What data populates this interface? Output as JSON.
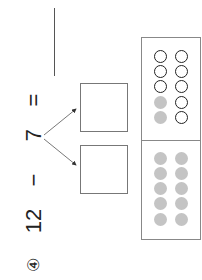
{
  "problem": {
    "number_badge": "④",
    "minuend": "12",
    "operator": "−",
    "subtrahend": "7",
    "equals": "=",
    "answer": ""
  },
  "decomposition": {
    "boxes": [
      {
        "value": ""
      },
      {
        "value": ""
      }
    ]
  },
  "ten_frame": {
    "top_half": {
      "column_1": [
        "open",
        "open",
        "open",
        "filled",
        "filled"
      ],
      "column_2": [
        "open",
        "open",
        "open",
        "open",
        "open"
      ]
    },
    "bottom_half": {
      "column_1": [
        "filled",
        "filled",
        "filled",
        "filled",
        "filled"
      ],
      "column_2": [
        "filled",
        "filled",
        "filled",
        "filled",
        "filled"
      ]
    },
    "colors": {
      "filled": "#c4c4c4",
      "open_stroke": "#222222",
      "border": "#888888"
    }
  }
}
